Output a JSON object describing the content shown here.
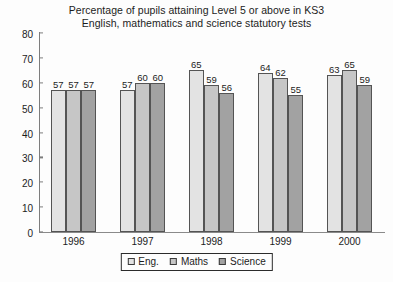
{
  "chart_data": {
    "type": "bar",
    "title": "Percentage of pupils attaining Level 5 or above in KS3 English, mathematics and science statutory tests",
    "title_lines": [
      "Percentage of pupils attaining Level 5 or above in KS3",
      "English, mathematics and science statutory tests"
    ],
    "xlabel": "",
    "ylabel": "",
    "categories": [
      "1996",
      "1997",
      "1998",
      "1999",
      "2000"
    ],
    "series": [
      {
        "name": "Eng.",
        "color": "#e3e3e3",
        "values": [
          57,
          57,
          65,
          64,
          63
        ]
      },
      {
        "name": "Maths",
        "color": "#c6c6c6",
        "values": [
          57,
          60,
          59,
          62,
          65
        ]
      },
      {
        "name": "Science",
        "color": "#a2a2a2",
        "values": [
          57,
          60,
          56,
          55,
          59
        ]
      }
    ],
    "ylim": [
      0,
      80
    ],
    "yticks": [
      80,
      70,
      60,
      50,
      40,
      30,
      20,
      10,
      0
    ],
    "grid": false,
    "legend_position": "bottom-center",
    "data_labels": true
  },
  "colors": {
    "background": "#fdfdfd",
    "axis": "#7d7d7d",
    "text": "#1c1c1c",
    "bar_border": "#545454"
  }
}
